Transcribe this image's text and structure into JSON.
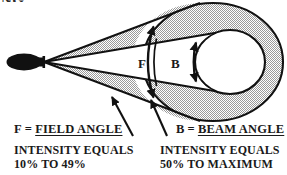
{
  "diagram": {
    "kind": "beam-angle-vs-field-angle-illumination-diagram",
    "clipped_title_fragment": "NG",
    "source": {
      "label_name": "lamp-light-source",
      "fill_color": "#111111"
    },
    "cones": {
      "field": {
        "letter": "F",
        "fill_color": "#d9d9d9",
        "fill_style": "stipple-halftone"
      },
      "beam": {
        "letter": "B",
        "fill_color": "#ffffff",
        "fill_style": "solid-white"
      }
    },
    "footprint": {
      "outer_ring_color": "#d9d9d9",
      "inner_circle_color": "#ffffff"
    },
    "stroke_color": "#111111"
  },
  "legend": {
    "field": {
      "symbol": "F",
      "equals": "=",
      "term": "FIELD ANGLE",
      "description_line1": "INTENSITY EQUALS",
      "description_line2": "10% TO 49%",
      "intensity_min_percent": 10,
      "intensity_max_percent": 49
    },
    "beam": {
      "symbol": "B",
      "equals": "=",
      "term": "BEAM ANGLE",
      "description_line1": "INTENSITY EQUALS",
      "description_line2": "50% TO MAXIMUM",
      "intensity_min_percent": 50,
      "intensity_max_percent": "MAXIMUM"
    }
  }
}
